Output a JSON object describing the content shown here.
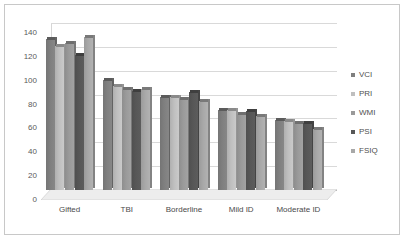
{
  "chart_data": {
    "type": "bar",
    "title": "",
    "subtitle": "",
    "xlabel": "",
    "ylabel": "",
    "categories": [
      "Gifted",
      "TBI",
      "Borderline",
      "Mild ID",
      "Moderate ID"
    ],
    "series": [
      {
        "name": "VCI",
        "values": [
          127,
          92,
          78,
          67,
          59
        ],
        "color": "#7f7f7f"
      },
      {
        "name": "PRI",
        "values": [
          121,
          87,
          78,
          67,
          58
        ],
        "color": "#bfbfbf"
      },
      {
        "name": "WMI",
        "values": [
          123,
          85,
          76,
          64,
          56
        ],
        "color": "#9a9a9a"
      },
      {
        "name": "PSI",
        "values": [
          113,
          83,
          82,
          66,
          56
        ],
        "color": "#575757"
      },
      {
        "name": "FSIQ",
        "values": [
          128,
          85,
          75,
          62,
          51
        ],
        "color": "#a8a8a8"
      }
    ],
    "ylim": [
      0,
      140
    ],
    "yticks": [
      0,
      20,
      40,
      60,
      80,
      100,
      120,
      140
    ],
    "ytick_labels": [
      "0",
      "20",
      "40",
      "60",
      "80",
      "100",
      "120",
      "140"
    ],
    "grid": true,
    "legend_position": "right",
    "style": "3d-clustered-column",
    "plot_background": "#ffffff",
    "gridline_color": "#d9d9d9",
    "border_color": "#c8c8c8"
  },
  "legend": {
    "items": [
      {
        "label": "VCI"
      },
      {
        "label": "PRI"
      },
      {
        "label": "WMI"
      },
      {
        "label": "PSI"
      },
      {
        "label": "FSIQ"
      }
    ]
  }
}
